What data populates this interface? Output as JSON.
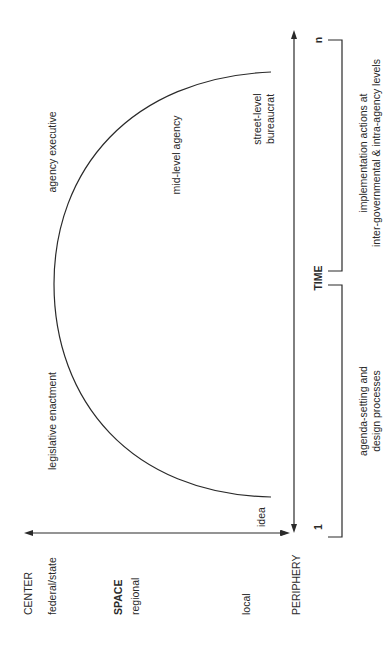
{
  "diagram": {
    "orientation": "rotated-90-ccw",
    "colors": {
      "ink": "#2a2a2a",
      "background": "#ffffff"
    },
    "space_axis": {
      "title": "SPACE",
      "center_label": "CENTER",
      "periphery_label": "PERIPHERY",
      "levels": [
        "federal/state",
        "regional",
        "local"
      ]
    },
    "time_axis": {
      "title": "TIME",
      "start_tick": "1",
      "end_tick": "n"
    },
    "curve_labels": {
      "idea": "idea",
      "legislative": "legislative enactment",
      "executive": "agency executive",
      "mid_level": "mid-level agency",
      "street_level_line1": "street-level",
      "street_level_line2": "bureaucrat"
    },
    "phases": {
      "early_line1": "agenda-setting and",
      "early_line2": "design processes",
      "late_line1": "implementation actions at",
      "late_line2": "inter-governmental & intra-agency levels"
    }
  }
}
